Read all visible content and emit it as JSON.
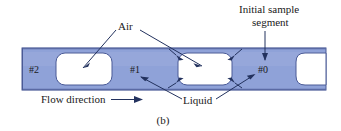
{
  "figure": {
    "caption": "(b)",
    "colors": {
      "liquid_fill": "#8fa2d8",
      "liquid_fill_light": "#a7b6e2",
      "tube_stroke": "#4a5a96",
      "air_fill": "#ffffff",
      "leader_stroke": "#23325e",
      "text": "#1a1a1a",
      "background": "#ffffff"
    },
    "callouts": [
      {
        "id": "air",
        "label": "Air"
      },
      {
        "id": "initial-sample-segment",
        "label_line1": "Initial sample",
        "label_line2": "segment"
      },
      {
        "id": "flow-direction",
        "label": "Flow direction"
      },
      {
        "id": "liquid",
        "label": "Liquid"
      }
    ],
    "segments": [
      {
        "id": "segment-2",
        "label": "#2"
      },
      {
        "id": "segment-1",
        "label": "#1"
      },
      {
        "id": "segment-0",
        "label": "#0"
      }
    ]
  }
}
